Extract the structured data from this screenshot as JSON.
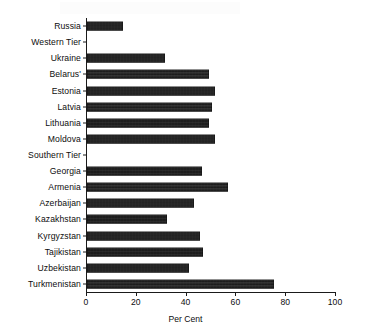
{
  "chart_data": {
    "type": "bar",
    "orientation": "horizontal",
    "title": "",
    "xlabel": "Per Cent",
    "ylabel": "",
    "xlim": [
      0,
      100
    ],
    "xticks": [
      0,
      20,
      40,
      60,
      80,
      100
    ],
    "grid": false,
    "legend": null,
    "bar_color": "#151515",
    "categories": [
      "Russia",
      "Western Tier",
      "Ukraine",
      "Belarus'",
      "Estonia",
      "Latvia",
      "Lithuania",
      "Moldova",
      "Southern Tier",
      "Georgia",
      "Armenia",
      "Azerbaijan",
      "Kazakhstan",
      "Kyrgyzstan",
      "Tajikistan",
      "Uzbekistan",
      "Turkmenistan"
    ],
    "values": [
      14.5,
      0,
      31.5,
      49,
      51.5,
      50,
      49,
      51.5,
      0,
      46,
      56.5,
      43,
      32,
      45.5,
      46.5,
      41,
      75
    ],
    "group_headers": [
      "Western Tier",
      "Southern Tier"
    ]
  },
  "footer": {
    "caption_remnant": ""
  }
}
